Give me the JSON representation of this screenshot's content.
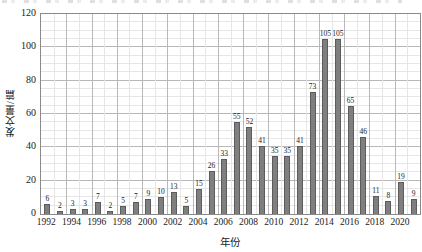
{
  "colors": {
    "bar_fill": "#7f7f7f",
    "bar_border": "#5c5c5c",
    "grid_minor": "#e6e6e6",
    "grid_major": "#b8b8b8",
    "plot_border": "#8a8a8a",
    "text": "#1a1a1a"
  },
  "chart_data": {
    "type": "bar",
    "title": "",
    "xlabel": "年份",
    "ylabel": "发文量/篇",
    "x": [
      1992,
      1993,
      1994,
      1995,
      1996,
      1997,
      1998,
      1999,
      2000,
      2001,
      2002,
      2003,
      2004,
      2005,
      2006,
      2007,
      2008,
      2009,
      2010,
      2011,
      2012,
      2013,
      2014,
      2015,
      2016,
      2017,
      2018,
      2019,
      2020,
      2021
    ],
    "values": [
      6,
      2,
      3,
      3,
      7,
      2,
      5,
      7,
      9,
      10,
      13,
      5,
      15,
      26,
      33,
      55,
      52,
      41,
      35,
      35,
      41,
      73,
      105,
      105,
      65,
      46,
      11,
      8,
      19,
      9
    ],
    "bar_value_labels": [
      "6",
      "2",
      "3",
      "3",
      "7",
      "2",
      "5",
      "7",
      "9",
      "10",
      "13",
      "5",
      "15",
      "26",
      "33",
      "55",
      "52",
      "41",
      "35",
      "35",
      "41",
      "73",
      "105",
      "105",
      "65",
      "46",
      "11",
      "8",
      "19",
      "9"
    ],
    "xtick_labels": [
      "1992",
      "1994",
      "1996",
      "1998",
      "2000",
      "2002",
      "2004",
      "2006",
      "2008",
      "2010",
      "2012",
      "2014",
      "2016",
      "2018",
      "2020"
    ],
    "xtick_years": [
      1992,
      1994,
      1996,
      1998,
      2000,
      2002,
      2004,
      2006,
      2008,
      2010,
      2012,
      2014,
      2016,
      2018,
      2020
    ],
    "yticks": [
      0,
      20,
      40,
      60,
      80,
      100,
      120
    ],
    "ylim": [
      0,
      120
    ],
    "y_minor_step": 5,
    "y_major_step": 20,
    "grid": "major+minor",
    "legend": "none"
  }
}
